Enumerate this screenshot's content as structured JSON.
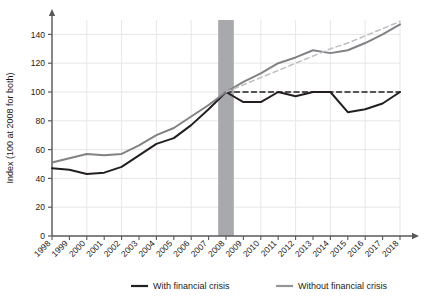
{
  "chart_data": {
    "type": "line",
    "title": "",
    "xlabel": "",
    "ylabel": "Index (100 at 2008 for both)",
    "ylim": [
      0,
      150
    ],
    "yticks": [
      0,
      20,
      40,
      60,
      80,
      100,
      120,
      140
    ],
    "grid": true,
    "legend_position": "bottom",
    "x": [
      1998,
      1999,
      2000,
      2001,
      2002,
      2003,
      2004,
      2005,
      2006,
      2007,
      2008,
      2009,
      2010,
      2011,
      2012,
      2013,
      2014,
      2015,
      2016,
      2017,
      2018
    ],
    "categories": [
      "1998",
      "1999",
      "2000",
      "2001",
      "2002",
      "2003",
      "2004",
      "2005",
      "2006",
      "2007",
      "2008",
      "2009",
      "2010",
      "2011",
      "2012",
      "2013",
      "2014",
      "2015",
      "2016",
      "2017",
      "2018"
    ],
    "series": [
      {
        "name": "With financial crisis",
        "color": "#231f20",
        "style": "solid",
        "values": [
          47,
          46,
          43,
          44,
          48,
          56,
          64,
          68,
          77,
          88,
          100,
          93,
          93,
          100,
          97,
          100,
          100,
          86,
          88,
          92,
          100
        ]
      },
      {
        "name": "Without financial crisis",
        "color": "#808285",
        "style": "solid",
        "values": [
          51,
          54,
          57,
          56,
          57,
          63,
          70,
          75,
          83,
          91,
          100,
          107,
          113,
          120,
          124,
          129,
          127,
          129,
          134,
          140,
          147
        ]
      },
      {
        "name": "With financial crisis trend",
        "color": "#231f20",
        "style": "dashed",
        "values": [
          null,
          null,
          null,
          null,
          null,
          null,
          null,
          null,
          null,
          null,
          100,
          100,
          100,
          100,
          100,
          100,
          100,
          100,
          100,
          100,
          100
        ]
      },
      {
        "name": "Without financial crisis trend",
        "color": "#bcbec0",
        "style": "dashed",
        "values": [
          null,
          null,
          null,
          null,
          null,
          null,
          null,
          null,
          null,
          null,
          100,
          105,
          110,
          115,
          120,
          125,
          130,
          134,
          139,
          144,
          149
        ]
      }
    ],
    "shaded_band": {
      "label": "2008",
      "from": 2007.55,
      "to": 2008.45,
      "color": "#a7a9ac"
    }
  },
  "legend": {
    "items": [
      {
        "label": "With financial crisis",
        "color": "#231f20"
      },
      {
        "label": "Without financial crisis",
        "color": "#939598"
      }
    ]
  },
  "axis": {
    "y_title": "Index (100 at 2008 for both)",
    "y_labels": [
      "0",
      "20",
      "40",
      "60",
      "80",
      "100",
      "120",
      "140"
    ],
    "x_labels": [
      "1998",
      "1999",
      "2000",
      "2001",
      "2002",
      "2003",
      "2004",
      "2005",
      "2006",
      "2007",
      "2008",
      "2009",
      "2010",
      "2011",
      "2012",
      "2013",
      "2014",
      "2015",
      "2016",
      "2017",
      "2018"
    ]
  },
  "colors": {
    "crisis_line": "#231f20",
    "no_crisis_line": "#808285",
    "band": "#a7a9ac",
    "grid": "#e8e6e6",
    "axis": "#58595b",
    "trend_dashed": "#bcbec0"
  }
}
